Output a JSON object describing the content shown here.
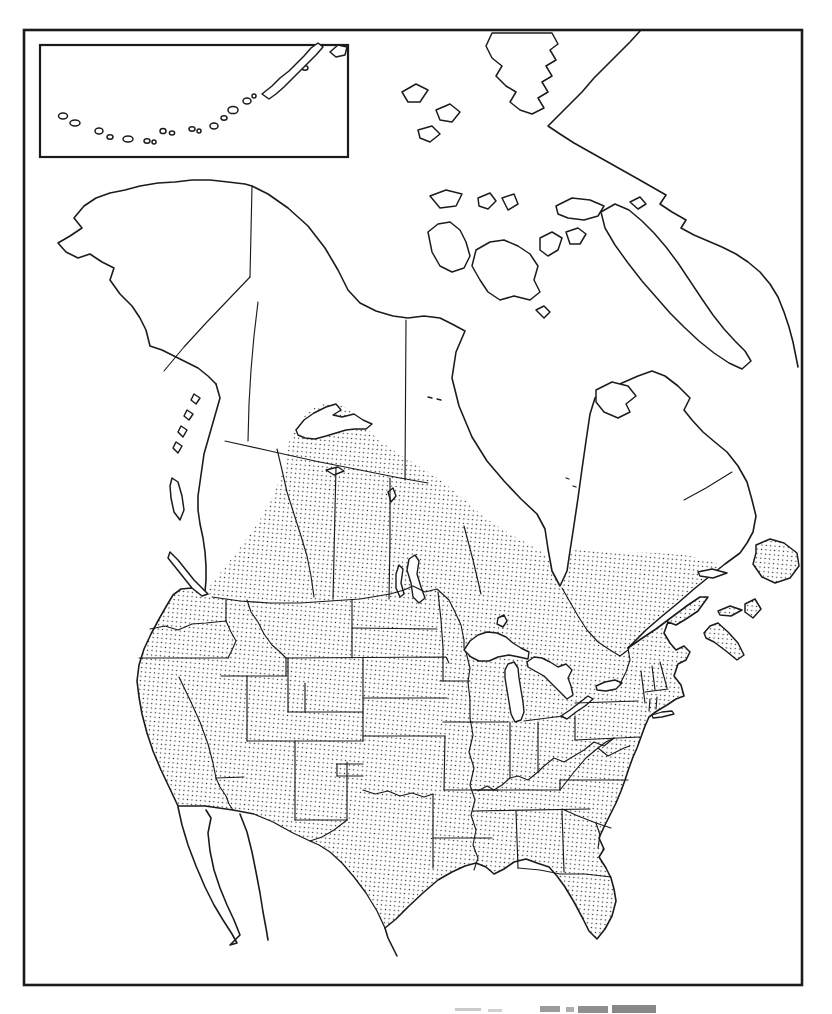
{
  "canvas": {
    "background": "#ffffff",
    "ink": "#1b1b1b",
    "stipple_dot": "#1b1b1b"
  },
  "figure": {
    "kind": "hand-drawn species range map (line art, scanned page)",
    "area_shown": "North America",
    "range_shading_style": "dense dot stipple",
    "range_extent": "contiguous United States and southern Canada, Maritimes and Newfoundland",
    "unshaded_areas": "Alaska, northern Canada and Arctic islands, Greenland, Mexico, Hudson Bay and Great Lakes water",
    "inset": {
      "corner": "top-left",
      "content": "Aleutian Islands chain and Alaska Peninsula",
      "shaded": false
    },
    "caption": {
      "present": true,
      "legible": false,
      "position": "bottom edge, cropped by page cut"
    }
  }
}
